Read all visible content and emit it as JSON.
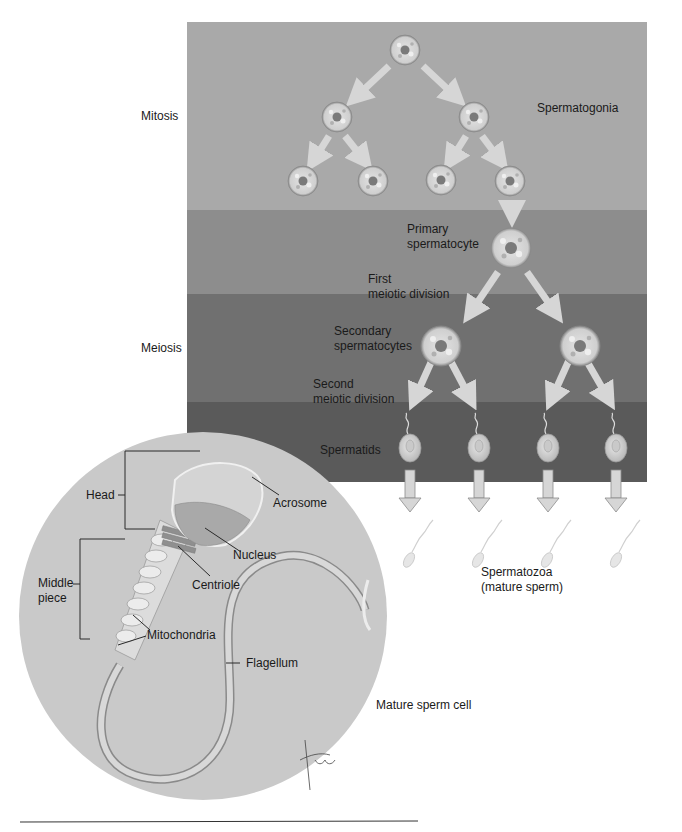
{
  "stages": {
    "mitosis": "Mitosis",
    "meiosis": "Meiosis"
  },
  "cells": {
    "spermatogonia": "Spermatogonia",
    "primary_1": "Primary",
    "primary_2": "spermatocyte",
    "first_div_1": "First",
    "first_div_2": "meiotic division",
    "secondary_1": "Secondary",
    "secondary_2": "spermatocytes",
    "second_div_1": "Second",
    "second_div_2": "meiotic division",
    "spermatids": "Spermatids",
    "spermatozoa_1": "Spermatozoa",
    "spermatozoa_2": "(mature sperm)"
  },
  "sperm_cell": {
    "title": "Mature sperm cell",
    "head": "Head",
    "acrosome": "Acrosome",
    "nucleus": "Nucleus",
    "centriole": "Centriole",
    "middle_piece_1": "Middle",
    "middle_piece_2": "piece",
    "mitochondria": "Mitochondria",
    "flagellum": "Flagellum",
    "signature": "tina"
  },
  "colors": {
    "band_spermatogonia": "#a9a9a9",
    "band_primary": "#8d8d8d",
    "band_secondary": "#707070",
    "band_spermatids": "#5a5a5a",
    "circle": "#c9c9c9",
    "arrow": "#d6d6d6"
  }
}
